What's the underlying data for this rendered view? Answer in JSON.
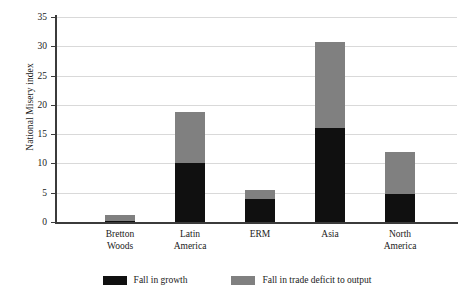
{
  "chart_data": {
    "type": "bar",
    "subtype": "stacked-bar",
    "title": "",
    "xlabel": "",
    "ylabel": "National Misery index",
    "categories": [
      "Bretton Woods",
      "Latin America",
      "ERM",
      "Asia",
      "North America"
    ],
    "category_lines": [
      [
        "Bretton",
        "Woods"
      ],
      [
        "Latin",
        "America"
      ],
      [
        "ERM"
      ],
      [
        "Asia"
      ],
      [
        "North",
        "America"
      ]
    ],
    "series": [
      {
        "name": "Fall in growth",
        "color": "#101010",
        "values": [
          0.2,
          10.0,
          4.0,
          16.0,
          4.7
        ]
      },
      {
        "name": "Fall in trade deficit to output",
        "color": "#808080",
        "values": [
          1.0,
          8.8,
          1.5,
          14.7,
          7.2
        ]
      }
    ],
    "totals": [
      1.2,
      18.8,
      5.5,
      30.7,
      11.9
    ],
    "ylim": [
      0,
      35
    ],
    "yticks": [
      0,
      5,
      10,
      15,
      20,
      25,
      30,
      35
    ],
    "ytick_labels": [
      "0",
      "5",
      "10",
      "15",
      "20",
      "25",
      "30",
      "35"
    ],
    "grid": true,
    "grid_axis": "y",
    "legend_position": "bottom",
    "legend": [
      {
        "label": "Fall in growth",
        "color": "#101010"
      },
      {
        "label": "Fall in trade deficit to output",
        "color": "#808080"
      }
    ]
  }
}
